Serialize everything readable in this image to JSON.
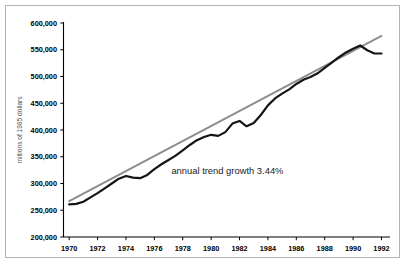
{
  "chart_data": {
    "type": "line",
    "title": "",
    "xlabel": "",
    "ylabel": "millions of 1985 dollars",
    "xlim": [
      1969.6,
      1992.6
    ],
    "ylim": [
      200000,
      600000
    ],
    "grid": false,
    "legend_position": "none",
    "x_tick_labels": [
      "1970",
      "1972",
      "1974",
      "1976",
      "1978",
      "1980",
      "1982",
      "1984",
      "1986",
      "1988",
      "1990",
      "1992"
    ],
    "x_tick_values": [
      1970,
      1972,
      1974,
      1976,
      1978,
      1980,
      1982,
      1984,
      1986,
      1988,
      1990,
      1992
    ],
    "y_tick_labels": [
      "200,000",
      "250,000",
      "300,000",
      "350,000",
      "400,000",
      "450,000",
      "500,000",
      "550,000",
      "600,000"
    ],
    "y_tick_values": [
      200000,
      250000,
      300000,
      350000,
      400000,
      450000,
      500000,
      550000,
      600000
    ],
    "annotations": [
      {
        "text": "annual trend growth 3.44%",
        "x": 1977.2,
        "y": 317000
      }
    ],
    "series": [
      {
        "name": "actual",
        "color": "#151515",
        "x": [
          1970.0,
          1970.5,
          1971.0,
          1971.5,
          1972.0,
          1972.5,
          1973.0,
          1973.5,
          1974.0,
          1974.5,
          1975.0,
          1975.5,
          1976.0,
          1976.5,
          1977.0,
          1977.5,
          1978.0,
          1978.5,
          1979.0,
          1979.5,
          1980.0,
          1980.5,
          1981.0,
          1981.5,
          1982.0,
          1982.5,
          1983.0,
          1983.5,
          1984.0,
          1984.5,
          1985.0,
          1985.5,
          1986.0,
          1986.5,
          1987.0,
          1987.5,
          1988.0,
          1988.5,
          1989.0,
          1989.5,
          1990.0,
          1990.5,
          1991.0,
          1991.5,
          1992.0
        ],
        "y": [
          261000,
          262000,
          266000,
          274000,
          282000,
          291000,
          300000,
          309000,
          314000,
          311000,
          310000,
          316000,
          327000,
          336000,
          344000,
          352000,
          362000,
          372000,
          381000,
          387000,
          391000,
          389000,
          396000,
          412000,
          417000,
          407000,
          413000,
          428000,
          446000,
          459000,
          468000,
          476000,
          486000,
          494000,
          499000,
          506000,
          516000,
          526000,
          536000,
          545000,
          552000,
          558000,
          549000,
          543000,
          543000
        ]
      },
      {
        "name": "trend",
        "color": "#8c8c8c",
        "x": [
          1970.0,
          1992.0
        ],
        "y": [
          267000,
          576000
        ]
      }
    ]
  },
  "axis": {
    "y_label": "millions of 1985 dollars"
  }
}
